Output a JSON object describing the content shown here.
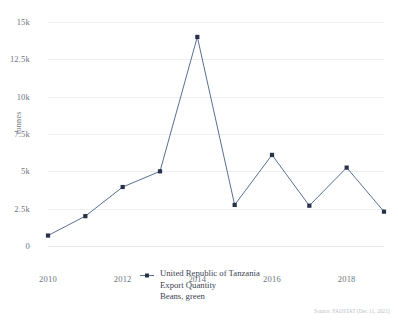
{
  "chart_data": {
    "type": "line",
    "title": "",
    "subtitle": "",
    "xlabel": "",
    "ylabel": "tonnes",
    "x": [
      2010,
      2011,
      2012,
      2013,
      2014,
      2015,
      2016,
      2017,
      2018,
      2019
    ],
    "xtick_labels": [
      "2010",
      "2012",
      "2014",
      "2016",
      "2018"
    ],
    "xtick_values": [
      2010,
      2012,
      2014,
      2016,
      2018
    ],
    "xlim": [
      2010,
      2019
    ],
    "ytick_labels": [
      "0",
      "2.5k",
      "5k",
      "7.5k",
      "10k",
      "12.5k",
      "15k"
    ],
    "ytick_values": [
      0,
      2500,
      5000,
      7500,
      10000,
      12500,
      15000
    ],
    "ylim": [
      0,
      15000
    ],
    "grid": true,
    "legend_position": "bottom-center",
    "series": [
      {
        "name": "United Republic of Tanzania Export Quantity Beans, green",
        "color": "#5b6e93",
        "marker": "square",
        "values": [
          700,
          2000,
          3950,
          5000,
          14000,
          2750,
          6100,
          2700,
          5250,
          2300
        ]
      }
    ]
  },
  "axes": {
    "y_title": "tonnes"
  },
  "legend": {
    "marker_name": "line-square-marker",
    "line1": "United Republic of Tanzania",
    "line2": "Export Quantity",
    "line3": "Beans, green"
  },
  "footer": {
    "source": "Source: FAOSTAT (Dec 11, 2021)"
  },
  "colors": {
    "series": "#5b6e93",
    "grid": "#eceef2",
    "tick_text": "#6c7480",
    "legend_text": "#3a4454",
    "source_text": "#b6bcc6",
    "background": "#ffffff"
  }
}
